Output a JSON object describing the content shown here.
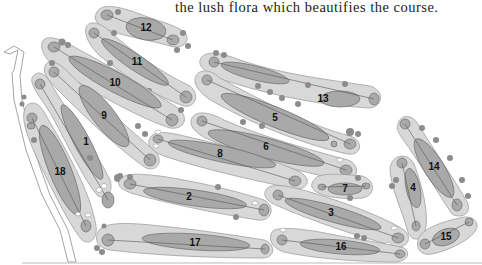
{
  "caption": "the lush flora which beautifies the course.",
  "colors": {
    "rough": "#d8d8d8",
    "fairway": "#a9a9a9",
    "outline": "#6e6e6e",
    "trees": "#8c8c8c"
  },
  "holes": [
    {
      "number": "1",
      "cx": 85,
      "cy": 140,
      "label_x": 86,
      "label_y": 142
    },
    {
      "number": "2",
      "cx": 190,
      "cy": 197,
      "label_x": 189,
      "label_y": 197
    },
    {
      "number": "3",
      "cx": 330,
      "cy": 213,
      "label_x": 331,
      "label_y": 213
    },
    {
      "number": "4",
      "cx": 413,
      "cy": 188,
      "label_x": 413,
      "label_y": 188
    },
    {
      "number": "5",
      "cx": 275,
      "cy": 117,
      "label_x": 275,
      "label_y": 118
    },
    {
      "number": "6",
      "cx": 266,
      "cy": 147,
      "label_x": 266,
      "label_y": 147
    },
    {
      "number": "7",
      "cx": 345,
      "cy": 189,
      "label_x": 345,
      "label_y": 189
    },
    {
      "number": "8",
      "cx": 220,
      "cy": 154,
      "label_x": 220,
      "label_y": 154
    },
    {
      "number": "9",
      "cx": 104,
      "cy": 116,
      "label_x": 104,
      "label_y": 116
    },
    {
      "number": "10",
      "cx": 115,
      "cy": 83,
      "label_x": 115,
      "label_y": 83
    },
    {
      "number": "11",
      "cx": 137,
      "cy": 62,
      "label_x": 137,
      "label_y": 62
    },
    {
      "number": "12",
      "cx": 146,
      "cy": 28,
      "label_x": 146,
      "label_y": 28
    },
    {
      "number": "13",
      "cx": 323,
      "cy": 99,
      "label_x": 323,
      "label_y": 99
    },
    {
      "number": "14",
      "cx": 434,
      "cy": 167,
      "label_x": 434,
      "label_y": 167
    },
    {
      "number": "15",
      "cx": 446,
      "cy": 237,
      "label_x": 446,
      "label_y": 237
    },
    {
      "number": "16",
      "cx": 341,
      "cy": 247,
      "label_x": 341,
      "label_y": 247
    },
    {
      "number": "17",
      "cx": 195,
      "cy": 243,
      "label_x": 195,
      "label_y": 243
    },
    {
      "number": "18",
      "cx": 60,
      "cy": 172,
      "label_x": 60,
      "label_y": 172
    }
  ]
}
